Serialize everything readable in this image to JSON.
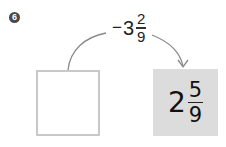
{
  "problem": {
    "number": "6"
  },
  "operation": {
    "sign": "−",
    "whole": "3",
    "numerator": "2",
    "denominator": "9"
  },
  "input_box": {
    "value": ""
  },
  "result_box": {
    "whole": "2",
    "numerator": "5",
    "denominator": "9"
  },
  "colors": {
    "badge": "#4a4a4a",
    "empty_box_border": "#c8c8c8",
    "result_box_fill": "#dcdcdc",
    "arrow": "#8a8a8a"
  }
}
